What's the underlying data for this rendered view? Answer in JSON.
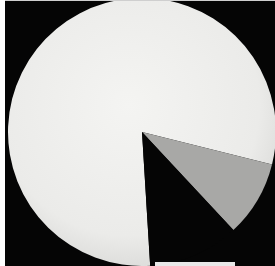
{
  "chart_data": {
    "type": "pie",
    "title": "",
    "categories": [
      "Slice A (light)",
      "Slice B (gray)",
      "Slice C (black)"
    ],
    "values": [
      80,
      9,
      11
    ],
    "angles_deg_clockwise_from_top": [
      {
        "name": "Slice A (light)",
        "start": 176.5,
        "end": 464.0,
        "color": "#ececea"
      },
      {
        "name": "Slice B (gray)",
        "start": 104.0,
        "end": 137.0,
        "color": "#a8a8a6"
      },
      {
        "name": "Slice C (black)",
        "start": 137.0,
        "end": 176.5,
        "color": "#050505"
      }
    ],
    "legend": [],
    "xlabel": "",
    "ylabel": "",
    "grid": false,
    "background": "#050505",
    "center": [
      142,
      132
    ],
    "radius": 134
  }
}
